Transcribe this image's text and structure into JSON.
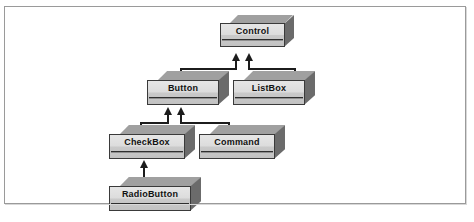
{
  "figure": {
    "type": "class-hierarchy-diagram",
    "caption": "",
    "colors": {
      "frame_border": "#9a9a9a",
      "box_front": "#dcdcdc",
      "box_top": "#a8a8a8",
      "box_side": "#6e6e6e",
      "box_outline": "#3a3a3a",
      "connector": "#1c1c1c",
      "background": "#ffffff",
      "text": "#111111"
    },
    "nodes": [
      {
        "id": "control",
        "label": "Control"
      },
      {
        "id": "button",
        "label": "Button"
      },
      {
        "id": "listbox",
        "label": "ListBox"
      },
      {
        "id": "checkbox",
        "label": "CheckBox"
      },
      {
        "id": "command",
        "label": "Command"
      },
      {
        "id": "radiobutton",
        "label": "RadioButton"
      }
    ],
    "edges": [
      {
        "from": "button",
        "to": "control",
        "kind": "generalization"
      },
      {
        "from": "listbox",
        "to": "control",
        "kind": "generalization"
      },
      {
        "from": "checkbox",
        "to": "button",
        "kind": "generalization"
      },
      {
        "from": "command",
        "to": "button",
        "kind": "generalization"
      },
      {
        "from": "radiobutton",
        "to": "checkbox",
        "kind": "generalization"
      }
    ]
  }
}
